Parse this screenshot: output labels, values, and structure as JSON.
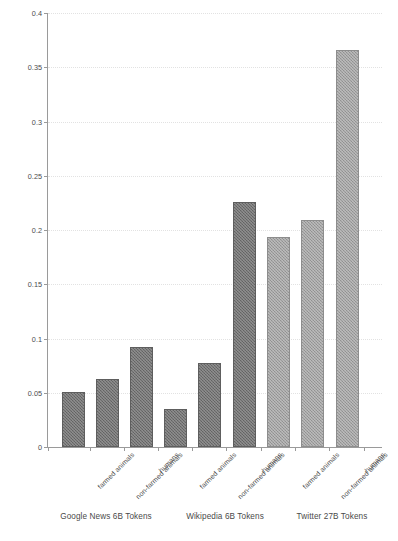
{
  "chart_data": {
    "type": "bar",
    "title": "",
    "subtitle": "",
    "xlabel": "",
    "ylabel": "mean word cosine distance",
    "ylim": [
      0,
      0.4
    ],
    "ytick_labels": [
      "0",
      "0.05",
      "0.1",
      "0.15",
      "0.2",
      "0.25",
      "0.3",
      "0.35",
      "0.4"
    ],
    "ytick_values": [
      0,
      0.05,
      0.1,
      0.15,
      0.2,
      0.25,
      0.3,
      0.35,
      0.4
    ],
    "grid": true,
    "legend": "none",
    "categories": [
      "farmed animals",
      "non-farmed animals",
      "humans",
      "farmed animals",
      "non-farmed animals",
      "humans",
      "farmed animals",
      "non-farmed animals",
      "humans"
    ],
    "values": [
      0.051,
      0.063,
      0.092,
      0.035,
      0.077,
      0.226,
      0.194,
      0.209,
      0.366
    ],
    "bar_colors": [
      "#6e6e6e",
      "#6e6e6e",
      "#6e6e6e",
      "#6e6e6e",
      "#6e6e6e",
      "#6e6e6e",
      "#9d9d9d",
      "#9d9d9d",
      "#9d9d9d"
    ],
    "groups": [
      {
        "label": "Google News 6B Tokens",
        "categories": [
          "farmed animals",
          "non-farmed animals",
          "humans"
        ],
        "values": [
          0.051,
          0.063,
          0.092
        ]
      },
      {
        "label": "Wikipedia 6B Tokens",
        "categories": [
          "farmed animals",
          "non-farmed animals",
          "humans"
        ],
        "values": [
          0.035,
          0.077,
          0.226
        ]
      },
      {
        "label": "Twitter 27B Tokens",
        "categories": [
          "farmed animals",
          "non-farmed animals",
          "humans"
        ],
        "values": [
          0.194,
          0.209,
          0.366
        ]
      }
    ],
    "colors": {
      "bar_dark": "#6e6e6e",
      "bar_light": "#9d9d9d",
      "axis": "#9a9a9a",
      "gridline": "#e2e2e2",
      "text": "#4c4c4c",
      "background": "#ffffff"
    }
  }
}
